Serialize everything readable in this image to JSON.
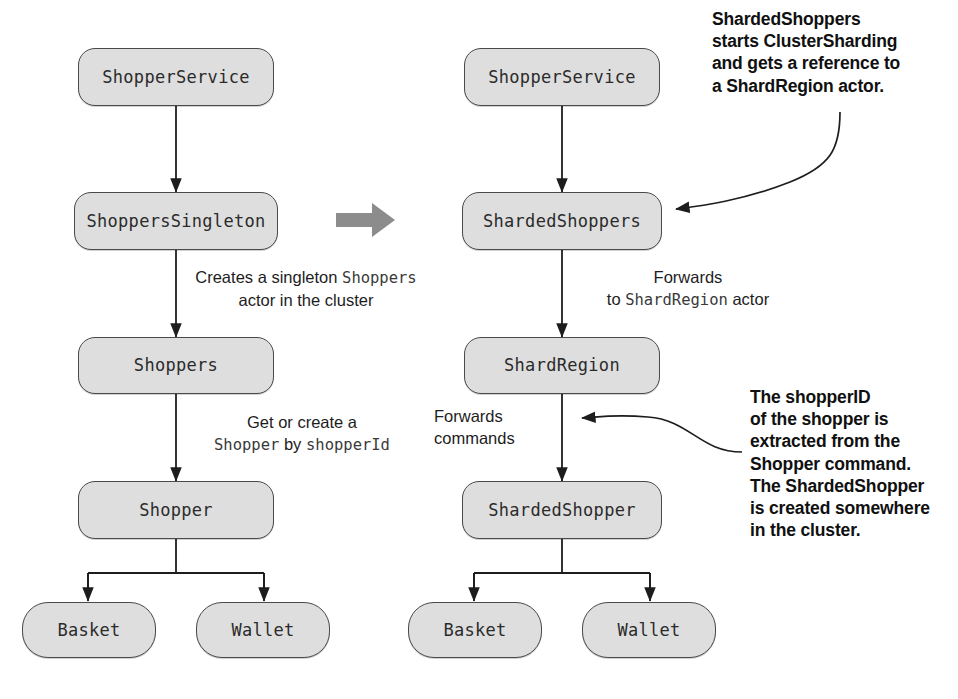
{
  "diagram": {
    "colors": {
      "node_fill": "#dedede",
      "node_stroke": "#4a4a4a",
      "connector": "#1d1d1d",
      "transition_arrow": "#8c8c8c",
      "text": "#1d1d1d",
      "callout_text": "#101010"
    },
    "left_column": {
      "name": "singleton-variant",
      "nodes": [
        {
          "id": "l-shopper-service",
          "label": "ShopperService"
        },
        {
          "id": "l-shoppers-singleton",
          "label": "ShoppersSingleton"
        },
        {
          "id": "l-shoppers",
          "label": "Shoppers"
        },
        {
          "id": "l-shopper",
          "label": "Shopper"
        },
        {
          "id": "l-basket",
          "label": "Basket"
        },
        {
          "id": "l-wallet",
          "label": "Wallet"
        }
      ],
      "edge_labels": [
        {
          "id": "l-edge-creates-singleton",
          "line1_pre": "Creates a singleton ",
          "line1_code": "Shoppers",
          "line2_pre": "actor in the cluster"
        },
        {
          "id": "l-edge-get-or-create",
          "line1_pre": "Get or create a",
          "line2_code_a": "Shopper",
          "line2_mid": " by ",
          "line2_code_b": "shopperId"
        }
      ]
    },
    "right_column": {
      "name": "sharding-variant",
      "nodes": [
        {
          "id": "r-shopper-service",
          "label": "ShopperService"
        },
        {
          "id": "r-sharded-shoppers",
          "label": "ShardedShoppers"
        },
        {
          "id": "r-shard-region",
          "label": "ShardRegion"
        },
        {
          "id": "r-sharded-shopper",
          "label": "ShardedShopper"
        },
        {
          "id": "r-basket",
          "label": "Basket"
        },
        {
          "id": "r-wallet",
          "label": "Wallet"
        }
      ],
      "edge_labels": [
        {
          "id": "r-edge-forwards-shardregion",
          "line1": "Forwards",
          "line2_pre": "to ",
          "line2_code": "ShardRegion",
          "line2_post": " actor"
        },
        {
          "id": "r-edge-forwards-commands",
          "line1": "Forwards",
          "line2": "commands"
        }
      ]
    },
    "callouts": [
      {
        "id": "callout-sharded-shoppers",
        "lines": [
          "ShardedShoppers",
          "starts ClusterSharding",
          "and gets a reference to",
          "a ShardRegion actor."
        ]
      },
      {
        "id": "callout-shopper-id",
        "lines": [
          "The shopperID",
          "of the shopper is",
          "extracted from the",
          "Shopper command.",
          "The ShardedShopper",
          "is created somewhere",
          "in the cluster."
        ]
      }
    ],
    "transition": {
      "id": "transition-arrow",
      "icon": "right-block-arrow",
      "direction": "right"
    }
  }
}
